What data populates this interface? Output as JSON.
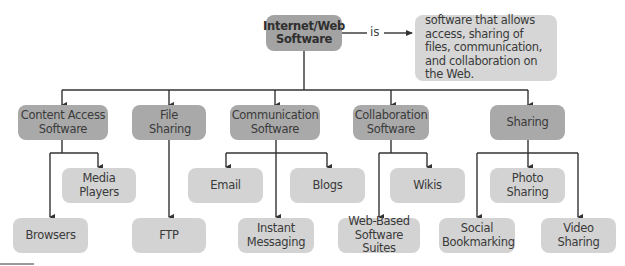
{
  "root": {
    "label": "Internet/Web Software"
  },
  "connector": {
    "label": "is"
  },
  "definition": {
    "text": "software that allows access, sharing of files, communication, and collaboration on the Web."
  },
  "categories": [
    {
      "label": "Content Access Software",
      "children": [
        "Media Players",
        "Browsers"
      ]
    },
    {
      "label": "File Sharing",
      "children": [
        "FTP"
      ]
    },
    {
      "label": "Communication Software",
      "children": [
        "Email",
        "Blogs",
        "Instant Messaging"
      ]
    },
    {
      "label": "Collaboration Software",
      "children": [
        "Wikis",
        "Web-Based Software Suites"
      ]
    },
    {
      "label": "Sharing",
      "children": [
        "Photo Sharing",
        "Social Bookmarking",
        "Video Sharing"
      ]
    }
  ],
  "leaves": {
    "media_players": "Media Players",
    "browsers": "Browsers",
    "ftp": "FTP",
    "email": "Email",
    "blogs": "Blogs",
    "instant_messaging": "Instant Messaging",
    "wikis": "Wikis",
    "web_based_suites": "Web-Based Software Suites",
    "photo_sharing": "Photo Sharing",
    "social_bookmarking": "Social Bookmarking",
    "video_sharing": "Video Sharing"
  },
  "colors": {
    "root": "#a3a3a3",
    "category": "#a9a9a9",
    "leaf": "#d3d3d3",
    "definition": "#d6d6d6",
    "line": "#333333"
  }
}
